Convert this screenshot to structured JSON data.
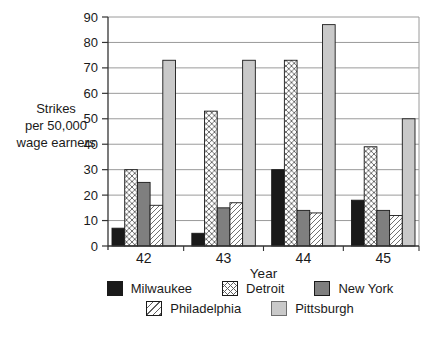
{
  "chart_data": {
    "type": "bar",
    "title": "",
    "xlabel": "Year",
    "ylabel_lines": [
      "Strikes",
      "per 50,000",
      "wage earners"
    ],
    "categories": [
      "42",
      "43",
      "44",
      "45"
    ],
    "series": [
      {
        "name": "Milwaukee",
        "pattern": "solid",
        "color": "#1a1a1a",
        "values": [
          7,
          5,
          30,
          18
        ]
      },
      {
        "name": "Detroit",
        "pattern": "crosshatch",
        "color": "#ffffff",
        "values": [
          30,
          53,
          73,
          39
        ]
      },
      {
        "name": "New York",
        "pattern": "solid",
        "color": "#7f7f7f",
        "values": [
          25,
          15,
          14,
          14
        ]
      },
      {
        "name": "Philadelphia",
        "pattern": "diagonal",
        "color": "#ffffff",
        "values": [
          16,
          17,
          13,
          12
        ]
      },
      {
        "name": "Pittsburgh",
        "pattern": "solid",
        "color": "#c9c9c9",
        "values": [
          73,
          73,
          87,
          50
        ]
      }
    ],
    "yticks": [
      0,
      10,
      20,
      30,
      40,
      50,
      60,
      70,
      80,
      90
    ],
    "ylim": [
      0,
      90
    ],
    "grid": true,
    "legend_position": "bottom"
  },
  "colors": {
    "background": "#ffffff",
    "axis": "#333333",
    "grid": "#9a9a9a",
    "bar_border": "#1a1a1a",
    "hatch": "#606060",
    "text": "#1a1a1a"
  }
}
